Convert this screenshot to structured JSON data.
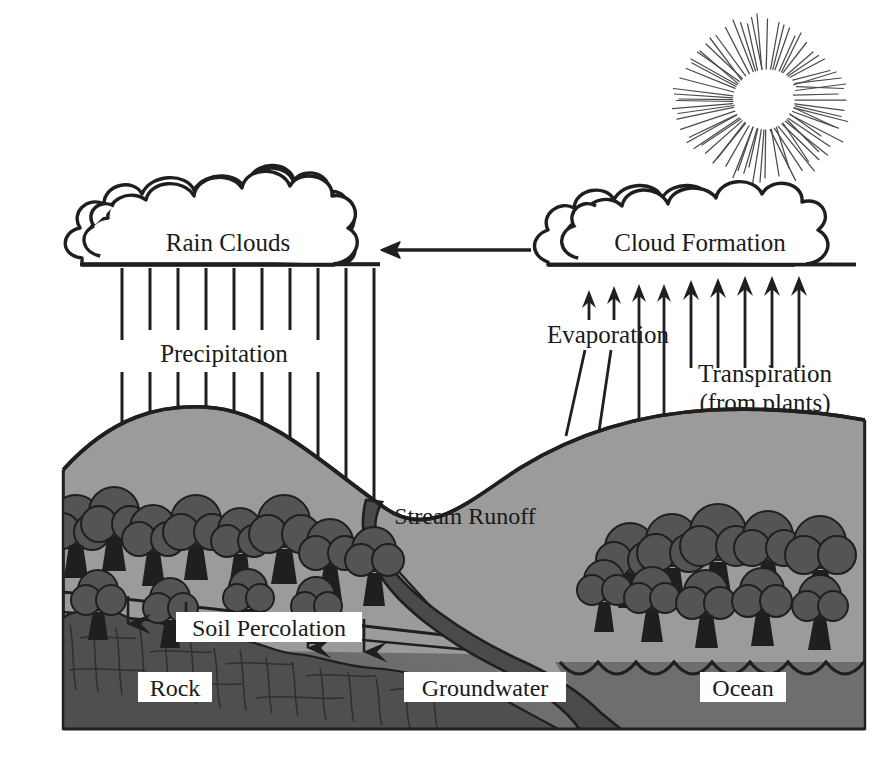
{
  "diagram": {
    "type": "process-diagram",
    "style": "grayscale line illustration",
    "canvas": {
      "width": 886,
      "height": 772
    }
  },
  "colors": {
    "background": "#ffffff",
    "ink": "#1f1f1f",
    "land_fill": "#9b9b9b",
    "land_fill_far": "#a3a3a3",
    "rock_fill": "#585858",
    "groundwater_fill": "#6e6e6e",
    "ocean_fill": "#6e6e6e",
    "tree_fill": "#545454",
    "stream_fill": "#4a4a4a",
    "label_box": "#ffffff",
    "sun_disc": "#ffffff",
    "sun_rays": "#4a4a4a"
  },
  "labels": {
    "rain_clouds": "Rain Clouds",
    "cloud_formation": "Cloud Formation",
    "precipitation": "Precipitation",
    "evaporation": "Evaporation",
    "transpiration": "Transpiration",
    "transpiration_sub": "(from plants)",
    "stream_runoff": "Stream Runoff",
    "soil_percolation": "Soil Percolation",
    "rock": "Rock",
    "groundwater": "Groundwater",
    "ocean": "Ocean"
  },
  "icons": {
    "sun": "sun-icon",
    "rain_cloud": "cloud-icon",
    "formation_cloud": "cloud-icon",
    "transport_arrow": "arrow-left-icon",
    "precipitation_arrow": "arrow-down-icon",
    "evaporation_arrow": "arrow-up-icon",
    "transpiration_arrow": "arrow-up-icon",
    "percolation_arrow": "arrow-down-icon",
    "tree": "tree-icon",
    "wave": "wave-icon"
  },
  "elements": {
    "sun": {
      "center_x": 765,
      "center_y": 100,
      "disc_radius": 27,
      "ray_count": 72,
      "ray_inner": 30,
      "ray_outer_min": 58,
      "ray_outer_max": 86
    },
    "rain_cloud": {
      "x": 75,
      "y": 180,
      "width": 305,
      "height": 85,
      "base_y": 265
    },
    "formation_cloud": {
      "x": 536,
      "y": 195,
      "width": 320,
      "height": 70,
      "base_y": 265
    },
    "transport_arrow": {
      "from_x": 530,
      "to_x": 383,
      "y": 250,
      "direction": "left"
    },
    "precipitation_arrows": {
      "count": 10,
      "x_start": 120,
      "x_step": 28,
      "top_y": 268
    },
    "evaporation_arrows": {
      "count": 4,
      "tip_y": 293,
      "slanted": true
    },
    "transpiration_arrows": {
      "count": 5,
      "tip_y": 290,
      "slanted": false
    },
    "percolation_arrows": {
      "count": 4
    },
    "trees_left": 12,
    "trees_right": 10,
    "ocean_waves": 8
  },
  "flow_steps": [
    {
      "step": 1,
      "name": "Evaporation",
      "from": "Ocean",
      "to": "Cloud Formation"
    },
    {
      "step": 2,
      "name": "Transpiration",
      "from": "Plants",
      "to": "Cloud Formation"
    },
    {
      "step": 3,
      "name": "Cloud Formation",
      "from": "Water vapor",
      "to": "Rain Clouds"
    },
    {
      "step": 4,
      "name": "Precipitation",
      "from": "Rain Clouds",
      "to": "Land"
    },
    {
      "step": 5,
      "name": "Soil Percolation",
      "from": "Land",
      "to": "Groundwater"
    },
    {
      "step": 6,
      "name": "Stream Runoff",
      "from": "Land",
      "to": "Ocean"
    }
  ]
}
